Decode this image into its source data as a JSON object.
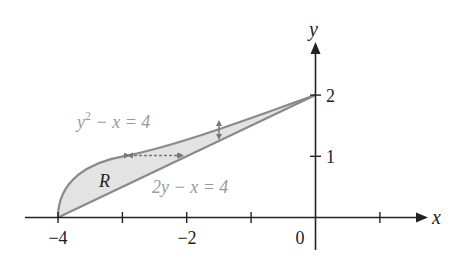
{
  "figure": {
    "axes": {
      "x_label": "x",
      "y_label": "y",
      "x_tick_labels": [
        {
          "value": -4,
          "text": "−4"
        },
        {
          "value": -2,
          "text": "−2"
        },
        {
          "value": 0,
          "text": "0"
        }
      ],
      "y_tick_labels": [
        {
          "value": 1,
          "text": "1"
        },
        {
          "value": 2,
          "text": "2"
        }
      ],
      "x_ticks": [
        -4,
        -3,
        -2,
        -1,
        1
      ],
      "y_ticks": [
        1,
        2
      ]
    },
    "curves": {
      "parabola_label": "y² − x = 4",
      "parabola_label_base": "y",
      "parabola_label_sup": "2",
      "parabola_label_rest": " − x = 4",
      "line_label": "2y − x = 4"
    },
    "region_label": "R",
    "colors": {
      "axis": "#222222",
      "curve": "#8a8a8a",
      "fill": "#e3e3e3",
      "label_gray": "#9a9a9a",
      "arrow": "#777777"
    }
  }
}
